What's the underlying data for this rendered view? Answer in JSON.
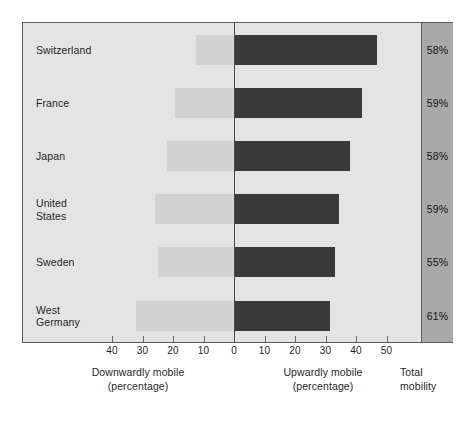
{
  "chart_data": {
    "type": "bar",
    "orientation": "horizontal",
    "subtype": "diverging-bidirectional",
    "title": "",
    "categories": [
      "Switzerland",
      "France",
      "Japan",
      "United States",
      "Sweden",
      "West Germany"
    ],
    "series": [
      {
        "name": "Downwardly mobile (percentage)",
        "direction": "left",
        "color": "#d2d2d2",
        "values": [
          12.5,
          19.5,
          22,
          26,
          25,
          32
        ]
      },
      {
        "name": "Upwardly mobile (percentage)",
        "direction": "right",
        "color": "#3a3a3a",
        "values": [
          47,
          42,
          38,
          34.5,
          33,
          31.5
        ]
      }
    ],
    "annotation_column": {
      "header": "Total\nmobility",
      "values": [
        "58%",
        "59%",
        "58%",
        "59%",
        "55%",
        "61%"
      ]
    },
    "xlabel_left": "Downwardly mobile\n(percentage)",
    "xlabel_right": "Upwardly mobile\n(percentage)",
    "ylabel": "",
    "xlim": [
      -45,
      58
    ],
    "axis": {
      "tick_values": [
        -40,
        -30,
        -20,
        -10,
        0,
        10,
        20,
        30,
        40,
        50
      ],
      "tick_labels": [
        "40",
        "30",
        "20",
        "10",
        "0",
        "10",
        "20",
        "30",
        "40",
        "50"
      ]
    },
    "grid": false,
    "legend": "none",
    "zero_line": true,
    "colors": {
      "plot_background": "#e4e4e4",
      "total_column_background": "#a8a8a8",
      "frame_border": "#5d5d5d",
      "downward_bar": "#d2d2d2",
      "upward_bar": "#3a3a3a",
      "text": "#1f1f1f"
    }
  },
  "rows": [
    {
      "label": "Switzerland",
      "down": 12.5,
      "up": 47,
      "total": "58%"
    },
    {
      "label": "France",
      "down": 19.5,
      "up": 42,
      "total": "59%"
    },
    {
      "label": "Japan",
      "down": 22,
      "up": 38,
      "total": "58%"
    },
    {
      "label": "United\nStates",
      "down": 26,
      "up": 34.5,
      "total": "59%"
    },
    {
      "label": "Sweden",
      "down": 25,
      "up": 33,
      "total": "55%"
    },
    {
      "label": "West\nGermany",
      "down": 32,
      "up": 31.5,
      "total": "61%"
    }
  ],
  "ticks": [
    {
      "value": -40,
      "label": "40"
    },
    {
      "value": -30,
      "label": "30"
    },
    {
      "value": -20,
      "label": "20"
    },
    {
      "value": -10,
      "label": "10"
    },
    {
      "value": 0,
      "label": "0"
    },
    {
      "value": 10,
      "label": "10"
    },
    {
      "value": 20,
      "label": "20"
    },
    {
      "value": 30,
      "label": "30"
    },
    {
      "value": 40,
      "label": "40"
    },
    {
      "value": 50,
      "label": "50"
    }
  ],
  "captions": {
    "downward": "Downwardly mobile\n(percentage)",
    "upward": "Upwardly mobile\n(percentage)",
    "total": "Total\nmobility"
  }
}
